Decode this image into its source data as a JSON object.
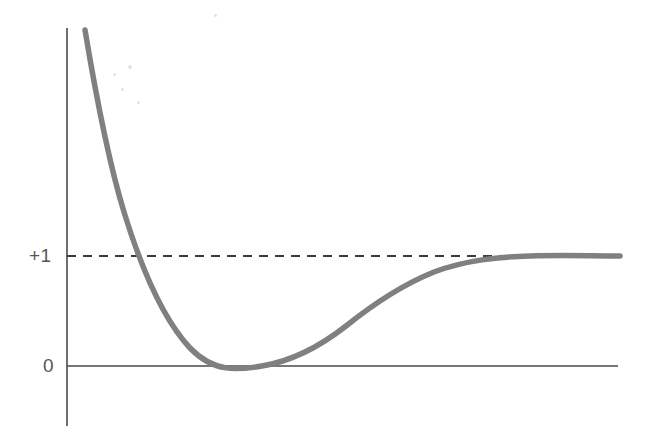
{
  "figure": {
    "background_color": "#ffffff",
    "width": 647,
    "height": 447
  },
  "axes": {
    "x_axis": {
      "name": "x-axis",
      "color": "#4a4a4a",
      "y_pixel": 366,
      "x_start_pixel": 67,
      "x_end_pixel": 618,
      "stroke_width": 1.6
    },
    "y_axis": {
      "name": "y-axis",
      "color": "#4a4a4a",
      "x_pixel": 67,
      "y_top_pixel": 28,
      "y_bottom_pixel": 426,
      "stroke_width": 1.6
    },
    "tick_labels": {
      "plus_one": "+1",
      "zero": "0"
    },
    "tick_label_color": "#555555"
  },
  "asymptote": {
    "name": "unity-asymptote",
    "value_label": "+1",
    "y_pixel": 256,
    "x_start_pixel": 67,
    "x_end_pixel": 620,
    "color": "#3c3c3c",
    "style": "dashed",
    "dash_pattern": "9 7",
    "stroke_width": 1.8
  },
  "curve": {
    "name": "potential-curve",
    "color": "#808080",
    "stroke_width": 5.5,
    "description": "steep repulsive branch falling from upper left, minimum touching zero, then rising asymptotically to +1"
  },
  "chart_data": {
    "type": "line",
    "title": "",
    "subtitle": "",
    "xlabel": "",
    "ylabel": "",
    "xlim": [
      0,
      10
    ],
    "ylim": [
      0,
      3.6
    ],
    "grid": false,
    "legend": null,
    "annotations": [
      {
        "text": "+1",
        "x": 0,
        "y": 1,
        "role": "y-tick-label"
      },
      {
        "text": "0",
        "x": 0,
        "y": 0,
        "role": "y-tick-label"
      }
    ],
    "reference_lines": [
      {
        "orientation": "horizontal",
        "y": 1,
        "label": "+1",
        "style": "dashed"
      }
    ],
    "series": [
      {
        "name": "curve",
        "x": [
          0.32,
          0.38,
          0.45,
          0.55,
          0.7,
          0.9,
          1.1,
          1.3,
          1.55,
          1.8,
          2.1,
          2.4,
          2.8,
          3.2,
          3.6,
          4.0,
          4.4,
          4.8,
          5.2,
          5.6,
          6.0,
          6.5,
          7.0,
          7.6,
          8.2,
          9.0,
          10.0
        ],
        "y": [
          3.55,
          3.05,
          2.5,
          1.92,
          1.32,
          0.86,
          0.56,
          0.35,
          0.18,
          0.08,
          0.01,
          0.0,
          0.04,
          0.12,
          0.24,
          0.38,
          0.52,
          0.64,
          0.74,
          0.82,
          0.88,
          0.93,
          0.96,
          0.98,
          0.99,
          1.0,
          1.0
        ]
      }
    ]
  },
  "specks": [
    {
      "left": 128,
      "top": 65,
      "size": 4
    },
    {
      "left": 113,
      "top": 73,
      "size": 3
    },
    {
      "left": 121,
      "top": 88,
      "size": 3
    },
    {
      "left": 137,
      "top": 101,
      "size": 3
    },
    {
      "left": 214,
      "top": 14,
      "size": 3
    }
  ]
}
